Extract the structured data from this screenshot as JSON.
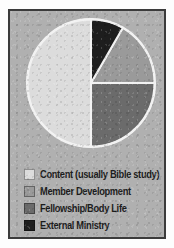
{
  "figure": {
    "background_color": "#b0b0b0",
    "border_color": "#3b3b3b",
    "page_color": "#fdfdfd"
  },
  "chart_data": {
    "type": "pie",
    "title": "",
    "subtitle": "",
    "xlabel": "",
    "ylabel": "",
    "grid": false,
    "legend_position": "bottom",
    "start_angle_deg": 0,
    "direction": "clockwise",
    "units": "percent",
    "categories": [
      "Content (usually Bible study)",
      "Member Development",
      "Fellowship/Body Life",
      "External Ministry"
    ],
    "values": [
      50,
      17,
      25,
      8
    ],
    "colors": [
      "#dcdcdc",
      "#9a9a9a",
      "#6b6b6b",
      "#1e1e1e"
    ],
    "slice_edge_color": "#f2f2f2",
    "slices": [
      {
        "label": "Content (usually Bible study)",
        "value": 50,
        "color": "#dcdcdc",
        "start_angle_deg": 180,
        "end_angle_deg": 360
      },
      {
        "label": "Member Development",
        "value": 17,
        "color": "#9a9a9a",
        "start_angle_deg": 30,
        "end_angle_deg": 90
      },
      {
        "label": "Fellowship/Body Life",
        "value": 25,
        "color": "#6b6b6b",
        "start_angle_deg": 90,
        "end_angle_deg": 180
      },
      {
        "label": "External Ministry",
        "value": 8,
        "color": "#1e1e1e",
        "start_angle_deg": 0,
        "end_angle_deg": 30
      }
    ]
  },
  "legend": {
    "items": [
      {
        "label": "Content (usually Bible study)",
        "color": "#dcdcdc"
      },
      {
        "label": "Member Development",
        "color": "#9a9a9a"
      },
      {
        "label": "Fellowship/Body Life",
        "color": "#6b6b6b"
      },
      {
        "label": "External Ministry",
        "color": "#1e1e1e"
      }
    ]
  }
}
